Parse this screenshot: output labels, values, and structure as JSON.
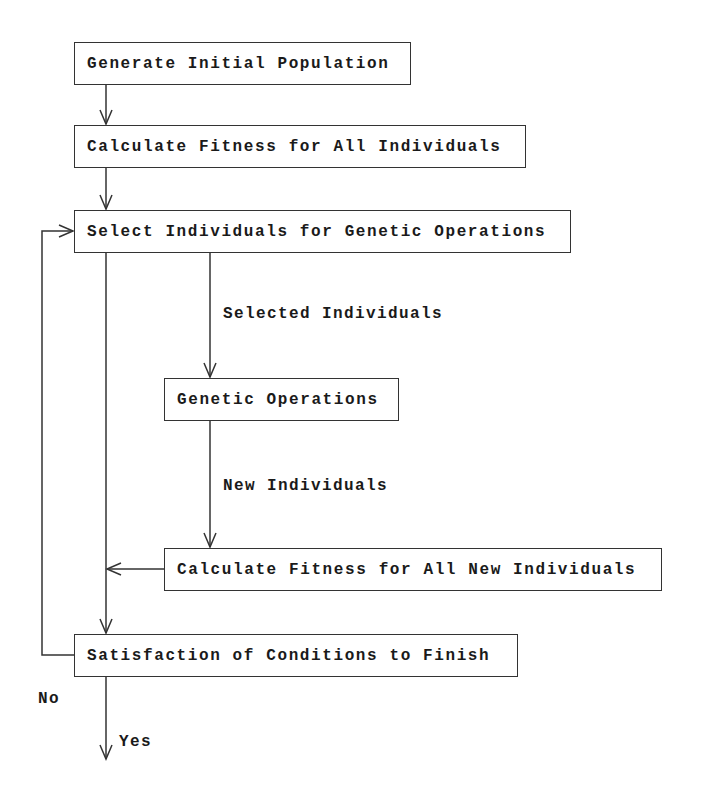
{
  "diagram": {
    "type": "flowchart",
    "nodes": [
      {
        "id": "n1",
        "label": "Generate Initial Population"
      },
      {
        "id": "n2",
        "label": "Calculate Fitness for All Individuals"
      },
      {
        "id": "n3",
        "label": "Select Individuals for Genetic Operations"
      },
      {
        "id": "n4",
        "label": "Genetic Operations"
      },
      {
        "id": "n5",
        "label": "Calculate Fitness for All New Individuals"
      },
      {
        "id": "n6",
        "label": "Satisfaction of Conditions to Finish"
      }
    ],
    "edge_labels": {
      "selected": "Selected Individuals",
      "new": "New Individuals",
      "no": "No",
      "yes": "Yes"
    },
    "edges": [
      {
        "from": "n1",
        "to": "n2"
      },
      {
        "from": "n2",
        "to": "n3"
      },
      {
        "from": "n3",
        "to": "n4",
        "label": "Selected Individuals"
      },
      {
        "from": "n4",
        "to": "n5",
        "label": "New Individuals"
      },
      {
        "from": "n5",
        "to": "n3-n6 line"
      },
      {
        "from": "n3",
        "to": "n6"
      },
      {
        "from": "n6",
        "to": "n3",
        "label": "No"
      },
      {
        "from": "n6",
        "to": "end",
        "label": "Yes"
      }
    ],
    "line_color": "#333333"
  }
}
